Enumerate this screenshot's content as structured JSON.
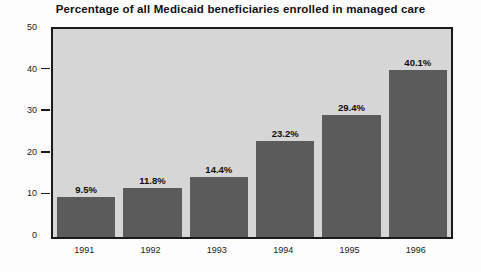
{
  "chart_data": {
    "type": "bar",
    "title": "Percentage of all Medicaid beneficiaries enrolled in managed care",
    "xlabel": "",
    "ylabel": "",
    "categories": [
      "1991",
      "1992",
      "1993",
      "1994",
      "1995",
      "1996"
    ],
    "values": [
      9.5,
      11.8,
      14.4,
      23.2,
      29.4,
      40.1
    ],
    "data_labels": [
      "9.5%",
      "11.8%",
      "14.4%",
      "23.2%",
      "29.4%",
      "40.1%"
    ],
    "ylim": [
      0,
      50
    ],
    "yticks": [
      0,
      10,
      20,
      30,
      40,
      50
    ],
    "ytick_labels": [
      "0",
      "10",
      "20",
      "30",
      "40",
      "50"
    ],
    "grid": false,
    "legend": null,
    "colors": {
      "bar_fill": "#5b5b5b",
      "plot_background": "#d6d6d6",
      "figure_background": "#fdfdfd",
      "axis_line": "#1a1a1a",
      "text": "#111111"
    }
  }
}
